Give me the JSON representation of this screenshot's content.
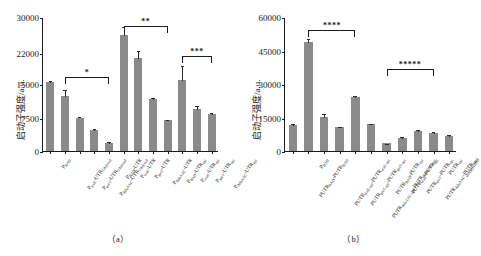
{
  "figure": {
    "panels": [
      {
        "key": "a",
        "caption": "（a）"
      },
      {
        "key": "b",
        "caption": "（b）"
      }
    ]
  },
  "chart_data": [
    {
      "type": "bar",
      "panel": "a",
      "title": "",
      "xlabel": "",
      "ylabel": "启动子强度/a.u.",
      "ylim": [
        0,
        30000
      ],
      "yticks": [
        0,
        7500,
        15000,
        22000,
        30000
      ],
      "ytick_labels": [
        "0",
        "7500",
        "15000",
        "22000",
        "30000"
      ],
      "grid": false,
      "legend": "none",
      "bar_color": "#8a8a8a",
      "categories": [
        "P_BAD",
        "P_araE-UTR_5'deleted",
        "P_gntT-UTR_5'deleted",
        "P_dalaAAC-UTR_5'deleted",
        "P_BAD-UTR",
        "P_araE-UTR",
        "P_gntT-UTR",
        "P_dalaAAC-UTR",
        "P_BAD-UTR_opt",
        "P_araE-UTR_opt",
        "P_gntT-UTR_opt",
        "P_dalaAAC-UTR_opt"
      ],
      "category_labels": [
        "P<sub>BAD</sub>",
        "P<sub>araE</sub>-UTR<sub>5'deleted</sub>",
        "P<sub>gntT</sub>-UTR<sub>5'deleted</sub>",
        "P<sub>dalaAAC</sub>-UTR<sub>5'deleted</sub>",
        "P<sub>BAD</sub>-UTR",
        "P<sub>araE</sub>-UTR",
        "P<sub>gntT</sub>-UTR",
        "P<sub>dalaAAC</sub>-UTR",
        "P<sub>BAD</sub>-UTR<sub>opt</sub>",
        "P<sub>araE</sub>-UTR<sub>opt</sub>",
        "P<sub>gntT</sub>-UTR<sub>opt</sub>",
        "P<sub>dalaAAC</sub>-UTR<sub>opt</sub>"
      ],
      "values": [
        15400,
        12300,
        7500,
        4700,
        1900,
        26000,
        20800,
        11700,
        6900,
        15800,
        9500,
        8300
      ],
      "errors": [
        500,
        1500,
        300,
        400,
        250,
        2000,
        1800,
        350,
        350,
        3500,
        800,
        400
      ],
      "annotations": [
        {
          "text": "*",
          "from_index": 1,
          "to_index": 4,
          "y": 16800
        },
        {
          "text": "**",
          "from_index": 5,
          "to_index": 8,
          "y": 28200
        },
        {
          "text": "***",
          "from_index": 9,
          "to_index": 11,
          "y": 21400
        }
      ]
    },
    {
      "type": "bar",
      "panel": "b",
      "title": "",
      "xlabel": "",
      "ylabel": "启动子强度/a.u.",
      "ylim": [
        0,
        60000
      ],
      "yticks": [
        0,
        15000,
        30000,
        45000,
        60000
      ],
      "ytick_labels": [
        "0",
        "15000",
        "30000",
        "45000",
        "60000"
      ],
      "grid": false,
      "legend": "none",
      "bar_color": "#8a8a8a",
      "categories": [
        "PUTR_BAD-PUTR_BAD",
        "P_BAD",
        "PUTR_araE-opt-PUTR_araE-opt",
        "PUTR_gntT-opt-PUTR_gntT-opt",
        "PUTR_dalaAAC-opt-PUTR_dalaAAC-opt",
        "PUTR_BAD-PUTR_opt",
        "PUTR_araE-PUTR_opt",
        "PUTR_gntT-PUTR_opt",
        "PUTR_dalaAAC-PUTR_opt",
        "PUTR_opt"
      ],
      "category_labels": [
        "PUTR<sub>BAD</sub>-PUTR<sub>BAD</sub>",
        "P<sub>BAD</sub>",
        "PUTR<sub>araE-opt</sub>-PUTR<sub>araE-opt</sub>",
        "PUTR<sub>gntT-opt</sub>-PUTR<sub>gntT-opt</sub>",
        "PUTR<sub>dalaAAC-opt</sub>-PUTR<sub>dalaAAC-opt</sub>",
        "PUTR<sub>BAD</sub>-PUTR<sub>opt</sub>",
        "PUTR<sub>araE</sub>-PUTR<sub>opt</sub>",
        "PUTR<sub>gntT</sub>-PUTR<sub>opt</sub>",
        "PUTR<sub>dalaAAC</sub>-PUTR<sub>opt</sub>",
        "PUTR<sub>opt</sub>"
      ],
      "values": [
        11700,
        49000,
        15100,
        10600,
        24000,
        11900,
        3400,
        6000,
        9000,
        8000,
        6700
      ],
      "errors": [
        700,
        1800,
        1900,
        800,
        1100,
        600,
        300,
        900,
        900,
        800,
        700
      ],
      "annotations": [
        {
          "text": "****",
          "from_index": 1,
          "to_index": 4,
          "y": 54500
        },
        {
          "text": "*****",
          "from_index": 6,
          "to_index": 9,
          "y": 37000
        }
      ]
    }
  ]
}
